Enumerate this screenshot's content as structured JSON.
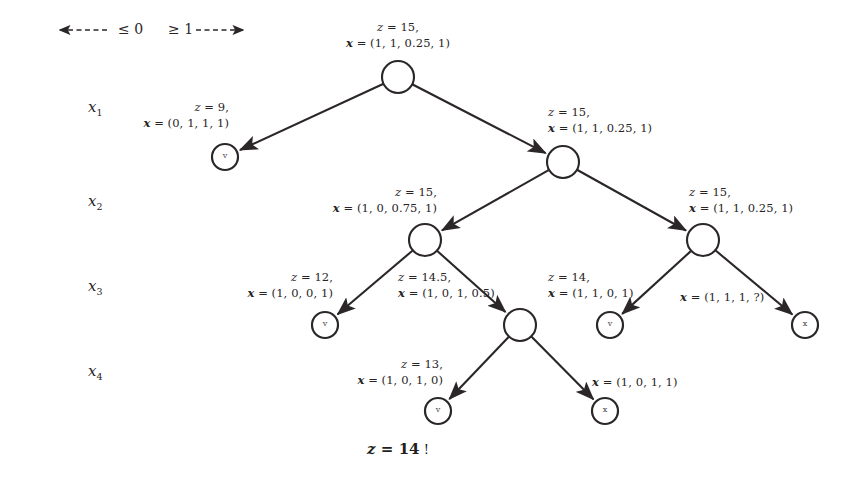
{
  "diagram": {
    "background": "#ffffff",
    "stroke_color": "#2b2728",
    "text_color": "#282425",
    "result": {
      "z_symbol": "z",
      "equals": " = ",
      "value": "14",
      "bang": "!",
      "full": "z = 14 !"
    }
  },
  "legend": {
    "left_arrow_glyph": "◄",
    "left_dashes": "- - - -",
    "left_label": "≤ 0",
    "right_label": "≥ 1",
    "right_dashes": "- - - -",
    "right_arrow_glyph": "►"
  },
  "row_vars": [
    {
      "name": "x",
      "sub": "1"
    },
    {
      "name": "x",
      "sub": "2"
    },
    {
      "name": "x",
      "sub": "3"
    },
    {
      "name": "x",
      "sub": "4"
    }
  ],
  "nodes": [
    {
      "id": "root",
      "kind": "internal",
      "glyph": "",
      "cx": 398,
      "cy": 77,
      "r": 16,
      "label": {
        "z": "z = 15,",
        "x": "x = (1, 1, 0.25, 1)",
        "align": "center",
        "lx": 398,
        "ly": 20
      }
    },
    {
      "id": "n1-left",
      "kind": "leaf",
      "glyph": "v",
      "cx": 225,
      "cy": 157,
      "r": 13,
      "label": {
        "z": "z = 9,",
        "x": "x = (0, 1, 1, 1)",
        "align": "right",
        "lx": 229,
        "ly": 100
      }
    },
    {
      "id": "n1-right",
      "kind": "internal",
      "glyph": "",
      "cx": 563,
      "cy": 162,
      "r": 16,
      "label": {
        "z": "z = 15,",
        "x": "x = (1, 1, 0.25, 1)",
        "align": "left",
        "lx": 548,
        "ly": 105
      }
    },
    {
      "id": "n2-left",
      "kind": "internal",
      "glyph": "",
      "cx": 425,
      "cy": 240,
      "r": 16,
      "label": {
        "z": "z = 15,",
        "x": "x = (1, 0, 0.75, 1)",
        "align": "right",
        "lx": 437,
        "ly": 185
      }
    },
    {
      "id": "n2-right",
      "kind": "internal",
      "glyph": "",
      "cx": 703,
      "cy": 240,
      "r": 16,
      "label": {
        "z": "z = 15,",
        "x": "x = (1, 1, 0.25, 1)",
        "align": "left",
        "lx": 689,
        "ly": 185
      }
    },
    {
      "id": "n3-a",
      "kind": "leaf",
      "glyph": "v",
      "cx": 325,
      "cy": 325,
      "r": 13,
      "label": {
        "z": "z = 12,",
        "x": "x = (1, 0, 0, 1)",
        "align": "right",
        "lx": 333,
        "ly": 270
      }
    },
    {
      "id": "n3-b",
      "kind": "internal",
      "glyph": "",
      "cx": 520,
      "cy": 325,
      "r": 16,
      "label": {
        "z": "z = 14.5,",
        "x": "x = (1, 0, 1, 0.5)",
        "align": "left",
        "lx": 398,
        "ly": 270
      }
    },
    {
      "id": "n3-c",
      "kind": "leaf",
      "glyph": "v",
      "cx": 610,
      "cy": 325,
      "r": 13,
      "label": {
        "z": "z = 14,",
        "x": "x = (1, 1, 0, 1)",
        "align": "left",
        "lx": 548,
        "ly": 270
      }
    },
    {
      "id": "n3-d",
      "kind": "leaf",
      "glyph": "x",
      "cx": 805,
      "cy": 325,
      "r": 13,
      "label": {
        "z": "",
        "x": "x = (1, 1, 1, ?)",
        "align": "left",
        "lx": 680,
        "ly": 290
      }
    },
    {
      "id": "n4-a",
      "kind": "leaf",
      "glyph": "v",
      "cx": 438,
      "cy": 411,
      "r": 13,
      "label": {
        "z": "z = 13,",
        "x": "x = (1, 0, 1, 0)",
        "align": "right",
        "lx": 443,
        "ly": 357
      }
    },
    {
      "id": "n4-b",
      "kind": "leaf",
      "glyph": "x",
      "cx": 605,
      "cy": 411,
      "r": 13,
      "label": {
        "z": "",
        "x": "x = (1, 0, 1, 1)",
        "align": "left",
        "lx": 592,
        "ly": 375
      }
    }
  ],
  "edges": [
    {
      "from": "root",
      "to": "n1-left",
      "branch": "le0"
    },
    {
      "from": "root",
      "to": "n1-right",
      "branch": "ge1"
    },
    {
      "from": "n1-right",
      "to": "n2-left",
      "branch": "le0"
    },
    {
      "from": "n1-right",
      "to": "n2-right",
      "branch": "ge1"
    },
    {
      "from": "n2-left",
      "to": "n3-a",
      "branch": "le0"
    },
    {
      "from": "n2-left",
      "to": "n3-b",
      "branch": "ge1"
    },
    {
      "from": "n2-right",
      "to": "n3-c",
      "branch": "le0"
    },
    {
      "from": "n2-right",
      "to": "n3-d",
      "branch": "ge1"
    },
    {
      "from": "n3-b",
      "to": "n4-a",
      "branch": "le0"
    },
    {
      "from": "n3-b",
      "to": "n4-b",
      "branch": "ge1"
    }
  ],
  "row_var_positions": [
    {
      "x": 88,
      "y": 98
    },
    {
      "x": 88,
      "y": 192
    },
    {
      "x": 88,
      "y": 277
    },
    {
      "x": 88,
      "y": 362
    }
  ]
}
